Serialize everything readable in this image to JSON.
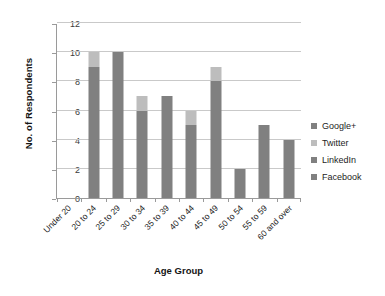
{
  "chart_data": {
    "type": "bar",
    "subtype": "stacked-column",
    "title": "",
    "xlabel": "Age Group",
    "ylabel": "No. of Respondents",
    "ylim": [
      0,
      12
    ],
    "ytick_step": 2,
    "yticks": [
      0,
      2,
      4,
      6,
      8,
      10,
      12
    ],
    "ytick_labels": [
      "0",
      "2",
      "4",
      "6",
      "8",
      "10",
      "12"
    ],
    "grid": true,
    "grid_axis": "y",
    "legend_position": "right",
    "categories": [
      "Under 20",
      "20 to 24",
      "25 to 29",
      "30 to 34",
      "35 to 39",
      "40 to 44",
      "45 to 49",
      "50 to 54",
      "55 to 59",
      "60 and over"
    ],
    "series": [
      {
        "name": "Facebook",
        "color": "#808080",
        "values": [
          0,
          9,
          10,
          6,
          7,
          5,
          8,
          2,
          5,
          4
        ]
      },
      {
        "name": "LinkedIn",
        "color": "#808080",
        "values": [
          0,
          0,
          0,
          0,
          0,
          0,
          0,
          0,
          0,
          0
        ]
      },
      {
        "name": "Twitter",
        "color": "#bdbdbd",
        "values": [
          0,
          1,
          0,
          1,
          0,
          1,
          1,
          0,
          0,
          0
        ]
      },
      {
        "name": "Google+",
        "color": "#808080",
        "values": [
          0,
          0,
          0,
          0,
          0,
          0,
          0,
          0,
          0,
          0
        ]
      }
    ],
    "totals": [
      0,
      10,
      10,
      7,
      7,
      6,
      9,
      2,
      5,
      4
    ],
    "legend_entries": [
      {
        "label": "Google+",
        "color": "#808080"
      },
      {
        "label": "Twitter",
        "color": "#bdbdbd"
      },
      {
        "label": "LinkedIn",
        "color": "#808080"
      },
      {
        "label": "Facebook",
        "color": "#808080"
      }
    ],
    "colors": {
      "dark_gray": "#808080",
      "light_gray": "#bdbdbd",
      "gridline": "#c9c9c9",
      "axis": "#9a9a9a",
      "background": "#ffffff"
    }
  }
}
